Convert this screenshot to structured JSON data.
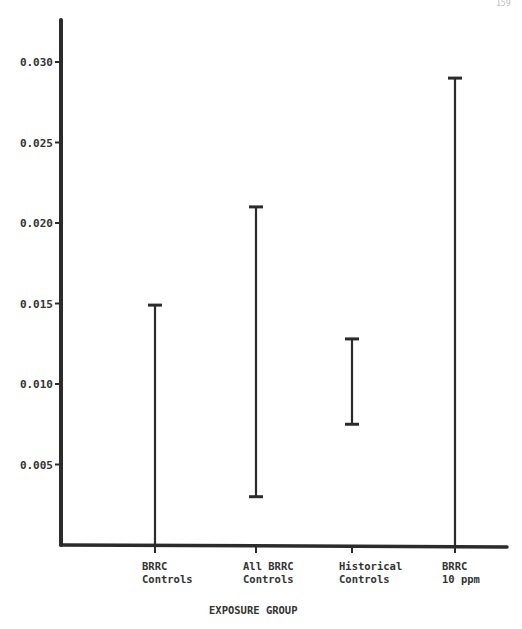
{
  "page_number": "159",
  "chart_data": {
    "type": "errorbar",
    "title": "",
    "xlabel": "EXPOSURE GROUP",
    "ylabel": "",
    "ylim": [
      0,
      0.032
    ],
    "yticks": [
      0.005,
      0.01,
      0.015,
      0.02,
      0.025,
      0.03
    ],
    "ytick_labels": [
      "0.005",
      "0.010",
      "0.015",
      "0.020",
      "0.025",
      "0.030"
    ],
    "grid": false,
    "legend": null,
    "categories": [
      {
        "line1": "BRRC",
        "line2": "Controls"
      },
      {
        "line1": "All BRRC",
        "line2": "Controls"
      },
      {
        "line1": "Historical",
        "line2": "Controls"
      },
      {
        "line1": "BRRC",
        "line2": "10 ppm"
      }
    ],
    "series": [
      {
        "name": "range",
        "intervals": [
          {
            "category": "BRRC Controls",
            "low": 0.0,
            "high": 0.0149
          },
          {
            "category": "All BRRC Controls",
            "low": 0.003,
            "high": 0.021
          },
          {
            "category": "Historical Controls",
            "low": 0.0075,
            "high": 0.0128
          },
          {
            "category": "BRRC 10 ppm",
            "low": 0.0,
            "high": 0.029
          }
        ]
      }
    ]
  },
  "layout": {
    "axis_x": 61,
    "axis_top": 20,
    "axis_bottom": 545,
    "axis_right": 507,
    "px_per_unit": 16100,
    "category_x": [
      155,
      256,
      352,
      455
    ],
    "cap_half_width": 7,
    "ink_color": "#2b2b2b"
  }
}
